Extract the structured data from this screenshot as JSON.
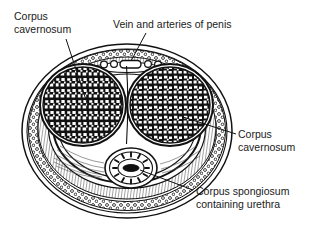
{
  "figure": {
    "background_color": "#ffffff",
    "ink_color": "#1a1a1a"
  },
  "labels": {
    "corpus_cavernosum_left": {
      "line1": "Corpus",
      "line2": "cavernosum"
    },
    "vein_arteries": {
      "line1": "Vein and arteries of penis"
    },
    "corpus_cavernosum_right": {
      "line1": "Corpus",
      "line2": "cavernosum"
    },
    "corpus_spongiosum": {
      "line1": "Corpus spongiosum",
      "line2": "containing urethra"
    }
  },
  "structures": [
    {
      "name": "skin-outer-boundary",
      "shape": "ellipse"
    },
    {
      "name": "dartos-stippled-band",
      "shape": "ellipse-ring"
    },
    {
      "name": "buck-fascia-hatched-band",
      "shape": "ellipse-ring"
    },
    {
      "name": "tunica-albuginea",
      "shape": "ellipse"
    },
    {
      "name": "corpus-cavernosum-left",
      "shape": "trabecular-mass"
    },
    {
      "name": "corpus-cavernosum-right",
      "shape": "trabecular-mass"
    },
    {
      "name": "corpus-spongiosum",
      "shape": "small-oval"
    },
    {
      "name": "urethra",
      "shape": "dark-slit"
    },
    {
      "name": "deep-dorsal-vein",
      "shape": "rounded-rect"
    },
    {
      "name": "dorsal-artery-left",
      "shape": "small-circle"
    },
    {
      "name": "dorsal-artery-right",
      "shape": "small-circle"
    },
    {
      "name": "dorsal-nerve-left",
      "shape": "small-circle"
    },
    {
      "name": "dorsal-nerve-right",
      "shape": "small-circle"
    }
  ]
}
